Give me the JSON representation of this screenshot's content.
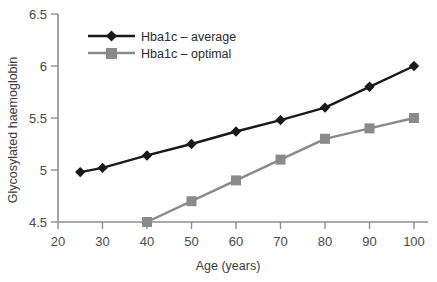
{
  "chart_data": {
    "type": "line",
    "title": "",
    "xlabel": "Age (years)",
    "ylabel": "Glycosylated haemoglobin",
    "xlim": [
      20,
      100
    ],
    "ylim": [
      4.5,
      6.5
    ],
    "xticks": [
      20,
      30,
      40,
      50,
      60,
      70,
      80,
      90,
      100
    ],
    "yticks": [
      4.5,
      5,
      5.5,
      6,
      6.5
    ],
    "xtick_labels": [
      "20",
      "30",
      "40",
      "50",
      "60",
      "70",
      "80",
      "90",
      "100"
    ],
    "ytick_labels": [
      "4.5",
      "5",
      "5.5",
      "6",
      "6.5"
    ],
    "grid": false,
    "legend_position": "upper left",
    "series": [
      {
        "name": "Hba1c – average",
        "color": "#1a1a1a",
        "marker": "diamond",
        "x": [
          25,
          30,
          40,
          50,
          60,
          70,
          80,
          90,
          100
        ],
        "values": [
          4.98,
          5.02,
          5.14,
          5.25,
          5.37,
          5.48,
          5.6,
          5.8,
          6.0
        ]
      },
      {
        "name": "Hba1c – optimal",
        "color": "#8a8a8a",
        "marker": "square",
        "x": [
          40,
          50,
          60,
          70,
          80,
          90,
          100
        ],
        "values": [
          4.5,
          4.7,
          4.9,
          5.1,
          5.3,
          5.4,
          5.5
        ]
      }
    ]
  },
  "axes": {
    "color": "#8e8e8e"
  },
  "legend": {
    "entries": [
      {
        "label": "Hba1c – average"
      },
      {
        "label": "Hba1c – optimal"
      }
    ]
  }
}
